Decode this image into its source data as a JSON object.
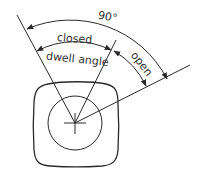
{
  "diagram": {
    "labels": {
      "total_angle": "90°",
      "closed": "closed",
      "dwell_angle": "dwell angle",
      "open": "open"
    },
    "angles_deg": {
      "total": 90,
      "closed_dwell": 60,
      "open": 30
    }
  }
}
